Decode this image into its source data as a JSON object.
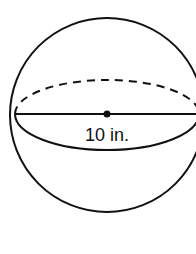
{
  "diagram": {
    "shape": "sphere",
    "diameter_label": "10 in.",
    "colors": {
      "stroke": "#111111",
      "background": "#ffffff"
    }
  }
}
